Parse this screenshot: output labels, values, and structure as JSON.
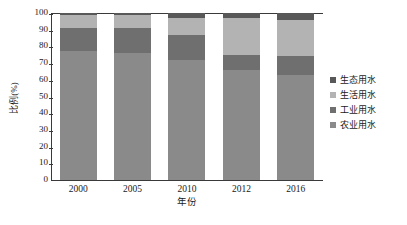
{
  "chart_data": {
    "type": "bar",
    "subtype": "stacked-percentage",
    "title": "",
    "xlabel": "年份",
    "ylabel": "比例(%)",
    "categories": [
      "2000",
      "2005",
      "2010",
      "2012",
      "2016"
    ],
    "ylim": [
      0,
      100
    ],
    "yticks": [
      0,
      10,
      20,
      30,
      40,
      50,
      60,
      70,
      80,
      90,
      100
    ],
    "ytick_labels": [
      "0",
      "10",
      "20",
      "30",
      "40",
      "50",
      "60",
      "70",
      "80",
      "90",
      "100"
    ],
    "grid": false,
    "legend_position": "right",
    "stack_order_bottom_to_top": [
      "农业用水",
      "工业用水",
      "生活用水",
      "生态用水"
    ],
    "series": [
      {
        "name": "生态用水",
        "color": "#585858",
        "values": [
          1,
          1,
          3,
          3,
          4
        ]
      },
      {
        "name": "生活用水",
        "color": "#b3b3b3",
        "values": [
          8,
          8,
          10,
          22,
          22
        ]
      },
      {
        "name": "工业用水",
        "color": "#6f6f6f",
        "values": [
          14,
          15,
          15,
          9,
          11
        ]
      },
      {
        "name": "农业用水",
        "color": "#8a8a8a",
        "values": [
          77,
          76,
          72,
          66,
          63
        ]
      }
    ]
  },
  "legend": {
    "items": [
      {
        "label": "生态用水",
        "color": "#585858"
      },
      {
        "label": "生活用水",
        "color": "#b3b3b3"
      },
      {
        "label": "工业用水",
        "color": "#6f6f6f"
      },
      {
        "label": "农业用水",
        "color": "#8a8a8a"
      }
    ]
  }
}
